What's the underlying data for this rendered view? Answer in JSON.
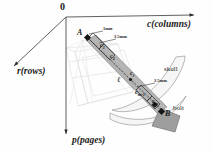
{
  "figure": {
    "background": "#fefefe",
    "origin_label": "0",
    "axes": [
      {
        "key": "rows",
        "label": "r(rows)"
      },
      {
        "key": "columns",
        "label": "c(columns)"
      },
      {
        "key": "pages",
        "label": "p(pages)"
      }
    ],
    "points": [
      {
        "key": "A",
        "label": "A"
      },
      {
        "key": "B",
        "label": "B"
      }
    ],
    "samples": [
      {
        "key": "c1",
        "base": "c",
        "sub": "1"
      },
      {
        "key": "c2",
        "base": "c",
        "sub": "2"
      },
      {
        "key": "ci",
        "base": "c",
        "sub": "i"
      },
      {
        "key": "cm1",
        "base": "c",
        "sub": "m-1"
      },
      {
        "key": "cm",
        "base": "c",
        "sub": "m"
      }
    ],
    "dimensions": [
      {
        "key": "dim-top",
        "label": "1mm"
      },
      {
        "key": "dim-upper",
        "label": "3.5mm"
      },
      {
        "key": "dim-lower",
        "label": "3.5mm"
      }
    ],
    "length_symbol": "ℓ",
    "parts": [
      {
        "key": "skull",
        "label": "skull"
      },
      {
        "key": "bolt",
        "label": "bolt"
      }
    ],
    "colors": {
      "axis": "#5a5a5a",
      "ink": "#1b1b1b",
      "bolt_shaft": "#a8a8a8",
      "bolt_head": "#9e9e9e",
      "skull_fill": "#f4f4f4",
      "wire": "#d8d8d8"
    }
  }
}
